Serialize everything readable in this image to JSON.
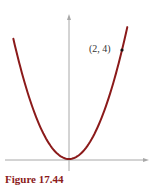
{
  "chart_data": {
    "type": "line",
    "title": "",
    "function": "y = x^2",
    "xlabel": "",
    "ylabel": "",
    "xlim": [
      -2.5,
      3.0
    ],
    "ylim": [
      -0.4,
      5.3
    ],
    "grid": false,
    "series": [
      {
        "name": "y = x^2",
        "color": "#8b1a1a",
        "x": [
          -2.1,
          -1.8,
          -1.5,
          -1.2,
          -0.9,
          -0.6,
          -0.3,
          0,
          0.3,
          0.6,
          0.9,
          1.2,
          1.5,
          1.8,
          2.0,
          2.2
        ],
        "y": [
          4.41,
          3.24,
          2.25,
          1.44,
          0.81,
          0.36,
          0.09,
          0,
          0.09,
          0.36,
          0.81,
          1.44,
          2.25,
          3.24,
          4.0,
          4.84
        ]
      }
    ],
    "annotations": [
      {
        "text": "(2, 4)",
        "x": 2,
        "y": 4,
        "marker": "dot"
      }
    ],
    "axes_color": "#a0a0a0"
  },
  "figure": {
    "point_label": "(2, 4)",
    "caption": "Figure 17.44"
  }
}
